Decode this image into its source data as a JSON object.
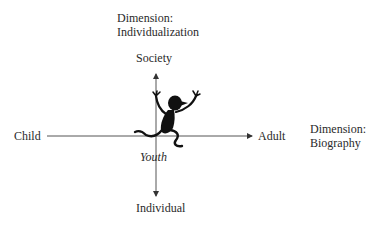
{
  "diagram": {
    "vertical_dimension": {
      "title_line1": "Dimension:",
      "title_line2": "Individualization",
      "top_label": "Society",
      "bottom_label": "Individual"
    },
    "horizontal_dimension": {
      "title_line1": "Dimension:",
      "title_line2": "Biography",
      "left_label": "Child",
      "right_label": "Adult"
    },
    "center_label": "Youth",
    "figure_icon": "jumping-person-silhouette",
    "colors": {
      "axis": "#555555",
      "text": "#2a2a2a",
      "figure": "#111111",
      "background": "#ffffff"
    }
  }
}
